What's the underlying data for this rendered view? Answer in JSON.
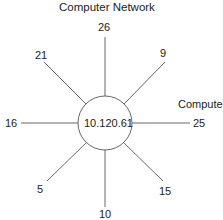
{
  "diagram": {
    "title": "Computer Network",
    "side_label": "Computer",
    "center_node": "10.120.61",
    "spokes": [
      {
        "label": "26"
      },
      {
        "label": "9"
      },
      {
        "label": "25"
      },
      {
        "label": "15"
      },
      {
        "label": "10"
      },
      {
        "label": "5"
      },
      {
        "label": "16"
      },
      {
        "label": "21"
      }
    ]
  }
}
